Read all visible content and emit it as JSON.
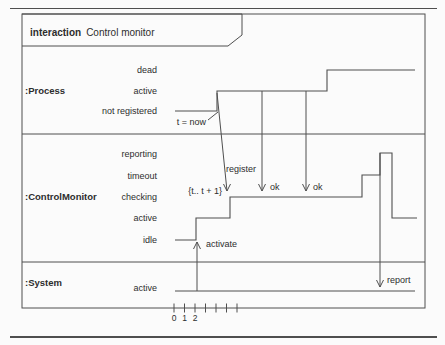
{
  "page": {
    "background": "#fbfbfb",
    "line_color": "#4f4f4f",
    "text_color": "#2d2d2d"
  },
  "frame": {
    "title_keyword": "interaction",
    "title_name": "Control monitor"
  },
  "diagram": {
    "type": "uml-timing-diagram",
    "lifelines": [
      {
        "name": ":Process",
        "name_y": 91,
        "states": [
          {
            "label": "dead",
            "y": 70
          },
          {
            "label": "active",
            "y": 91
          },
          {
            "label": "not registered",
            "y": 111
          }
        ],
        "timeline": [
          [
            175,
            111
          ],
          [
            217,
            111
          ],
          [
            217,
            91
          ],
          [
            327,
            91
          ],
          [
            327,
            70
          ],
          [
            415,
            70
          ]
        ]
      },
      {
        "name": ":ControlMonitor",
        "name_y": 197,
        "states": [
          {
            "label": "reporting",
            "y": 154
          },
          {
            "label": "timeout",
            "y": 176
          },
          {
            "label": "checking",
            "y": 197
          },
          {
            "label": "active",
            "y": 218
          },
          {
            "label": "idle",
            "y": 240
          }
        ],
        "timeline": [
          [
            175,
            240
          ],
          [
            196,
            240
          ],
          [
            196,
            218
          ],
          [
            230,
            218
          ],
          [
            230,
            197
          ],
          [
            362,
            197
          ],
          [
            362,
            175
          ],
          [
            380,
            175
          ],
          [
            380,
            153
          ],
          [
            392,
            153
          ],
          [
            392,
            218
          ],
          [
            417,
            218
          ]
        ]
      },
      {
        "name": ":System",
        "name_y": 283,
        "states": [
          {
            "label": "active",
            "y": 288
          }
        ],
        "timeline": [
          [
            175,
            291
          ],
          [
            415,
            291
          ]
        ]
      }
    ],
    "separators_y": [
      134,
      262
    ],
    "messages": [
      {
        "label": "activate",
        "from": [
          197,
          291
        ],
        "to": [
          197,
          242
        ],
        "dir": "up",
        "label_x": 206,
        "label_y": 244
      },
      {
        "label": "register",
        "from": [
          217,
          93
        ],
        "to": [
          227,
          191
        ],
        "dir": "down",
        "label_x": 226,
        "label_y": 169
      },
      {
        "label": "ok",
        "from": [
          262,
          91
        ],
        "to": [
          262,
          191
        ],
        "dir": "down",
        "label_x": 270,
        "label_y": 187
      },
      {
        "label": "ok",
        "from": [
          306,
          91
        ],
        "to": [
          306,
          191
        ],
        "dir": "down",
        "label_x": 313,
        "label_y": 187
      },
      {
        "label": "report",
        "from": [
          380,
          153
        ],
        "to": [
          380,
          287
        ],
        "dir": "down",
        "label_x": 387,
        "label_y": 280
      }
    ],
    "annotations": [
      {
        "text": "t = now",
        "right_x": 206,
        "y": 122,
        "pointer": [
          [
            208,
            120
          ],
          [
            218,
            112
          ]
        ]
      },
      {
        "text": "{t.. t + 1}",
        "right_x": 222,
        "y": 191
      }
    ],
    "axis": {
      "y": 308,
      "ticks_x": [
        174,
        184.5,
        195,
        205.5,
        216,
        226.5,
        237
      ],
      "labels": [
        {
          "text": "0",
          "x": 174
        },
        {
          "text": "1",
          "x": 184.5
        },
        {
          "text": "2",
          "x": 195
        }
      ],
      "label_y": 318
    }
  }
}
